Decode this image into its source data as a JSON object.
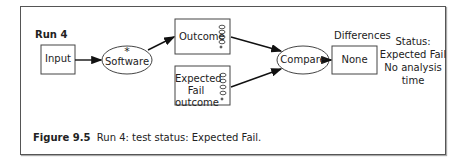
{
  "diagram": {
    "run_label": "Run 4",
    "nodes": {
      "input": "Input",
      "software": "Software",
      "software_marker": "*",
      "outcome": "Outcome",
      "expected_line1": "Expected",
      "expected_line2": "Fail",
      "expected_line3": "outcome",
      "compare": "Compare",
      "differences_label": "Differences",
      "none": "None"
    },
    "status": {
      "line1": "Status:",
      "line2": "Expected Fail",
      "line3": "No analysis",
      "line4": "time"
    }
  },
  "caption": {
    "number": "Figure 9.5",
    "text": "Run 4: test status: Expected Fail."
  }
}
